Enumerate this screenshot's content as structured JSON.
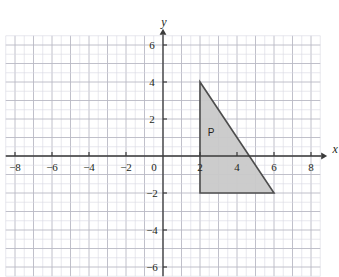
{
  "figure": {
    "type": "coordinate-grid",
    "background": "#ffffff",
    "grid": {
      "minor_color": "#d9d9e2",
      "major_color": "#b9b9c4",
      "minor_step_units": 0.5,
      "major_step_units": 1,
      "x_range": [
        -8.5,
        8.5
      ],
      "y_range": [
        -6.5,
        6.5
      ]
    },
    "axes": {
      "color": "#3a3a3a",
      "x_label": "x",
      "y_label": "y",
      "origin_label": "0",
      "x_ticks": [
        -8,
        -6,
        -4,
        -2,
        2,
        4,
        6,
        8
      ],
      "y_ticks": [
        6,
        4,
        2,
        -2,
        -4,
        -6
      ]
    },
    "shapes": [
      {
        "name": "P",
        "label": "P",
        "kind": "triangle",
        "vertices": [
          [
            2,
            4
          ],
          [
            2,
            -2
          ],
          [
            6,
            -2
          ]
        ],
        "fill": "#c9c9c9",
        "stroke": "#4d4d4d"
      }
    ]
  }
}
